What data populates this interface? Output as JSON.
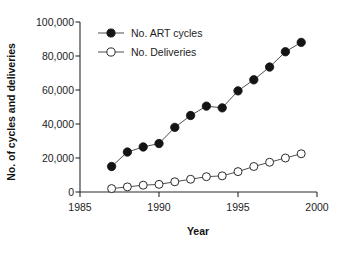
{
  "chart_data": {
    "type": "line",
    "title": "",
    "xlabel": "Year",
    "ylabel": "No. of cycles and deliveries",
    "xlim": [
      1985,
      2000
    ],
    "ylim": [
      0,
      100000
    ],
    "xticks": [
      1985,
      1990,
      1995,
      2000
    ],
    "xtick_labels": [
      "1985",
      "1990",
      "1995",
      "2000"
    ],
    "yticks": [
      0,
      20000,
      40000,
      60000,
      80000,
      100000
    ],
    "ytick_labels": [
      "0",
      "20,000",
      "40,000",
      "60,000",
      "80,000",
      "100,000"
    ],
    "grid": false,
    "legend_position": "upper left",
    "x": [
      1987,
      1988,
      1989,
      1990,
      1991,
      1992,
      1993,
      1994,
      1995,
      1996,
      1997,
      1998,
      1999
    ],
    "series": [
      {
        "name": "No. ART cycles",
        "marker": "filled-circle",
        "color": "#141414",
        "values": [
          15000,
          23500,
          26500,
          28500,
          38000,
          45000,
          50500,
          49500,
          59500,
          66000,
          73500,
          82500,
          88000
        ]
      },
      {
        "name": "No. Deliveries",
        "marker": "open-circle",
        "color": "#2b2b2b",
        "values": [
          2000,
          3000,
          4000,
          4500,
          6000,
          7500,
          9000,
          9500,
          12000,
          15000,
          17500,
          20000,
          22500
        ]
      }
    ]
  },
  "legend": {
    "items": [
      {
        "label": "No. ART cycles",
        "marker": "filled-circle"
      },
      {
        "label": "No. Deliveries",
        "marker": "open-circle"
      }
    ]
  },
  "axes": {
    "x_title": "Year",
    "y_title": "No. of cycles and deliveries"
  }
}
